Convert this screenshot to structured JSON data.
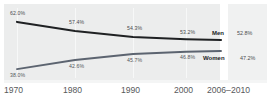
{
  "chart_data": {
    "type": "line",
    "title": "",
    "subtitle": "",
    "xlabel": "",
    "ylabel": "",
    "grid": true,
    "legend_position": "inline-right",
    "categories": [
      "1970",
      "1980",
      "1990",
      "2000",
      "2006–2010"
    ],
    "ylim": [
      36,
      64
    ],
    "series": [
      {
        "name": "Men",
        "color": "#1f2123",
        "values": [
          62.0,
          57.4,
          54.3,
          53.2,
          52.8
        ],
        "labels": [
          "62.0%",
          "57.4%",
          "54.3%",
          "53.2%",
          "52.8%"
        ]
      },
      {
        "name": "Women",
        "color": "#5c6470",
        "values": [
          38.0,
          42.6,
          45.7,
          46.8,
          47.2
        ],
        "labels": [
          "38.0%",
          "42.6%",
          "45.7%",
          "46.8%",
          "47.2%"
        ]
      }
    ]
  },
  "plot": {
    "background_color": "#eceded",
    "axis_strip_color": "#f4f5f5",
    "gridline_color": "#f7f8f8"
  },
  "xaxis": {
    "ticks": [
      "1970",
      "1980",
      "1990",
      "2000",
      "2006–2010"
    ]
  },
  "men": {
    "name": "Men",
    "v1970": "62.0%",
    "v1980": "57.4%",
    "v1990": "54.3%",
    "v2000": "53.2%",
    "v2006": "52.8%"
  },
  "women": {
    "name": "Women",
    "v1970": "38.0%",
    "v1980": "42.6%",
    "v1990": "45.7%",
    "v2000": "46.8%",
    "v2006": "47.2%"
  }
}
